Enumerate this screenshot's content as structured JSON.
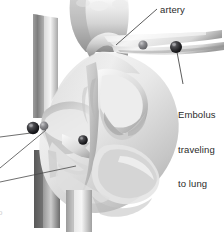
{
  "figure": {
    "background_color": "#ffffff",
    "width": 224,
    "height": 232
  },
  "labels": {
    "artery": "artery",
    "embolus_line1": "Embolus",
    "embolus_line2": "traveling",
    "embolus_line3": "to lung",
    "corner_mark": "o"
  },
  "colors": {
    "text": "#2b2b2b",
    "leader_line": "#4a4a4a",
    "embolus_dark": "#1e1e20",
    "embolus_mid": "#6e6e72",
    "tissue_light": "#f2f2f2",
    "tissue_mid": "#cfcfcf",
    "tissue_shadow": "#8d8d8d",
    "vessel_dark": "#6a6a6a"
  },
  "emboli": [
    {
      "name": "embolus-artery-right",
      "cx": 176,
      "cy": 47,
      "r": 6.0,
      "tone": "dark"
    },
    {
      "name": "embolus-artery-left",
      "cx": 143,
      "cy": 45,
      "r": 4.6,
      "tone": "mid"
    },
    {
      "name": "embolus-atrium-dark",
      "cx": 33,
      "cy": 128,
      "r": 6.2,
      "tone": "dark"
    },
    {
      "name": "embolus-atrium-mid",
      "cx": 44,
      "cy": 126,
      "r": 4.4,
      "tone": "mid"
    },
    {
      "name": "embolus-center",
      "cx": 83,
      "cy": 140,
      "r": 4.8,
      "tone": "dark"
    }
  ],
  "leader_lines": [
    {
      "name": "leader-artery",
      "x1": 157,
      "x2": 116,
      "y1": 9,
      "y2": 45
    },
    {
      "name": "leader-embolus",
      "x1": 177,
      "x2": 183,
      "y1": 50,
      "y2": 84
    },
    {
      "name": "leader-left-upper",
      "x1": 0,
      "x2": 31,
      "y1": 137,
      "y2": 133
    },
    {
      "name": "leader-left-middle",
      "x1": 0,
      "x2": 46,
      "y1": 168,
      "y2": 133
    },
    {
      "name": "leader-left-lower",
      "x1": 0,
      "x2": 74,
      "y1": 182,
      "y2": 168
    }
  ]
}
